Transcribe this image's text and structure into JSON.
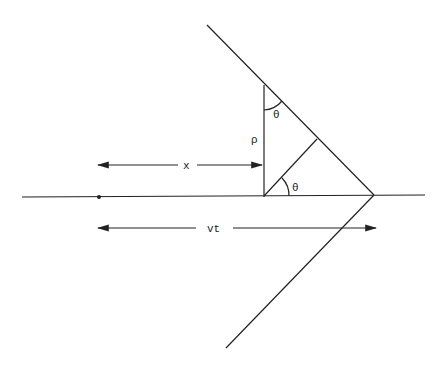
{
  "diagram": {
    "type": "geometry",
    "labels": {
      "x": "x",
      "vt": "vt",
      "rho": "ρ",
      "theta_top": "θ",
      "theta_bottom": "θ"
    },
    "colors": {
      "line": "#222222",
      "background": "#ffffff"
    }
  }
}
